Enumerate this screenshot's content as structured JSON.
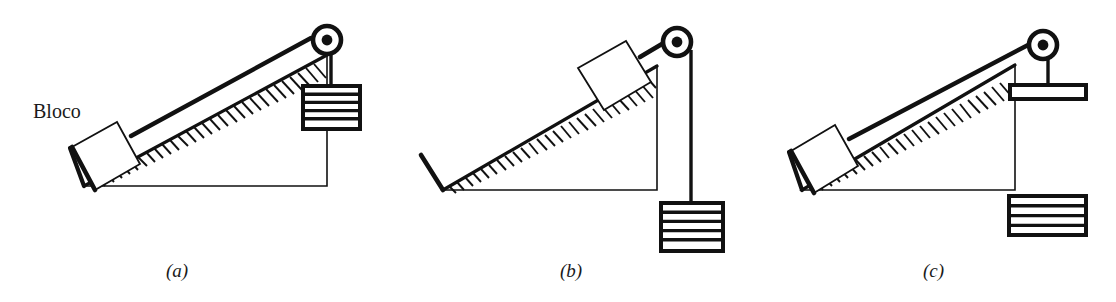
{
  "figure": {
    "background_color": "#ffffff",
    "ink_color": "#111111"
  },
  "annotations": {
    "block_label": "Bloco"
  },
  "panels": [
    {
      "id": "a",
      "caption": "(a)",
      "description": "Block on incline connected by string over pulley at apex to hanging weight",
      "parts": {
        "incline": "hatched-inclined-plane",
        "block": "block-on-incline",
        "string": "string-along-incline",
        "pulley": "pulley-at-apex",
        "load": "striped-hanging-weight"
      },
      "load_stripes": 5
    },
    {
      "id": "b",
      "caption": "(b)",
      "description": "Block near top of incline, string over pulley, weight hanging lower beside incline",
      "parts": {
        "incline": "hatched-inclined-plane",
        "block": "block-near-top-of-incline",
        "string": "string-along-incline",
        "pulley": "pulley-at-apex",
        "load": "striped-hanging-weight"
      },
      "load_stripes": 5
    },
    {
      "id": "c",
      "caption": "(c)",
      "description": "Block on incline, string over pulley to a flat pan; separate striped weight sits below the pan",
      "parts": {
        "incline": "hatched-inclined-plane",
        "block": "block-on-incline",
        "string": "string-along-incline",
        "pulley": "pulley-at-apex",
        "load": "flat-hanging-pan",
        "extra": "striped-weight-below-pan"
      },
      "load_stripes": 4
    }
  ],
  "captions": {
    "a": "(a)",
    "b": "(b)",
    "c": "(c)"
  }
}
